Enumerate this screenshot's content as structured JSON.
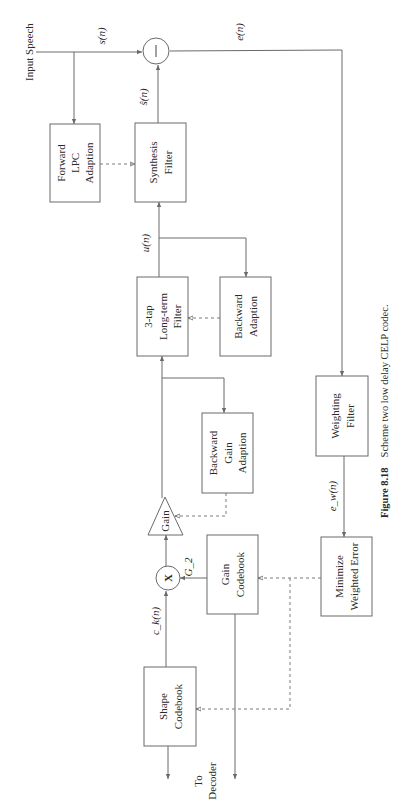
{
  "figure": {
    "caption_number": "Figure 8.18",
    "caption_text": "Scheme two low delay CELP codec."
  },
  "inputs": {
    "input_speech": "Input Speech",
    "to_decoder_line1": "To",
    "to_decoder_line2": "Decoder"
  },
  "signals": {
    "s_n": "s(n)",
    "s_hat_n": "ŝ(n)",
    "e_n": "e(n)",
    "u_n": "u(n)",
    "e_w_n": "e_w(n)",
    "c_k_n": "c_k(n)",
    "g2": "G_2"
  },
  "operators": {
    "subtract": "—",
    "multiply": "X"
  },
  "blocks": {
    "forward_lpc": [
      "Forward",
      "LPC",
      "Adaption"
    ],
    "synthesis_filter": [
      "Synthesis",
      "Filter"
    ],
    "long_term_filter": [
      "3-tap",
      "Long-term",
      "Filter"
    ],
    "backward_adaption": [
      "Backward",
      "Adaption"
    ],
    "backward_gain_adaption": [
      "Backward",
      "Gain",
      "Adaption"
    ],
    "gain": "Gain",
    "gain_codebook": [
      "Gain",
      "Codebook"
    ],
    "shape_codebook": [
      "Shape",
      "Codebook"
    ],
    "weighting_filter": [
      "Weighting",
      "Filter"
    ],
    "minimize_error": [
      "Minimize",
      "Weighted Error"
    ]
  }
}
